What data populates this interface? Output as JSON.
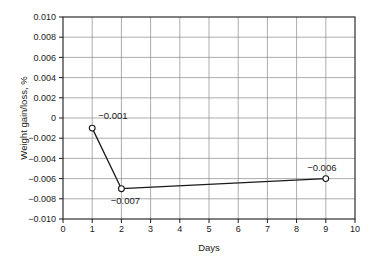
{
  "chart_data": {
    "type": "line",
    "title": "",
    "xlabel": "Days",
    "ylabel": "Weight gain/loss, %",
    "xlim": [
      0,
      10
    ],
    "ylim": [
      -0.01,
      0.01
    ],
    "grid": true,
    "legend": "none",
    "marker": "open-circle",
    "x": [
      1,
      2,
      9
    ],
    "values": [
      -0.001,
      -0.007,
      -0.006
    ],
    "series": [
      {
        "name": "Weight gain/loss",
        "x": [
          1,
          2,
          9
        ],
        "values": [
          -0.001,
          -0.007,
          -0.006
        ]
      }
    ],
    "xticks": [
      "0",
      "1",
      "2",
      "3",
      "4",
      "5",
      "6",
      "7",
      "8",
      "9",
      "10"
    ],
    "xtick_values": [
      0,
      1,
      2,
      3,
      4,
      5,
      6,
      7,
      8,
      9,
      10
    ],
    "yticks": [
      "0.010",
      "0.008",
      "0.006",
      "0.004",
      "0.002",
      "0",
      "−0.002",
      "−0.004",
      "−0.006",
      "−0.008",
      "−0.010"
    ],
    "ytick_values": [
      0.01,
      0.008,
      0.006,
      0.004,
      0.002,
      0,
      -0.002,
      -0.004,
      -0.006,
      -0.008,
      -0.01
    ],
    "annotations": [
      {
        "text": "−0.001",
        "x": 1,
        "y": -0.001,
        "position": "above-right"
      },
      {
        "text": "−0.007",
        "x": 2,
        "y": -0.007,
        "position": "below"
      },
      {
        "text": "−0.006",
        "x": 9,
        "y": -0.006,
        "position": "above-left"
      }
    ],
    "colors": {
      "line": "#1a1a1a",
      "marker_fill": "#ffffff",
      "marker_edge": "#1a1a1a",
      "grid": "#8a8a8a",
      "frame": "#1a1a1a",
      "background": "#ffffff",
      "text": "#1a1a1a"
    }
  }
}
